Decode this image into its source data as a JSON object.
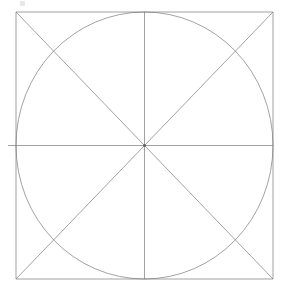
{
  "figure": {
    "background_color": "#ffffff",
    "stroke_color": "#7a7a7a",
    "stroke_width": 0.7,
    "canvas": {
      "width": 286,
      "height": 287
    },
    "square": {
      "label": "bounding-square",
      "x": 16,
      "y": 12,
      "width": 257,
      "height": 267
    },
    "circle": {
      "label": "inscribed-circle",
      "cx": 144.5,
      "cy": 145.5,
      "rx": 128.5,
      "ry": 133.5
    },
    "center_point": {
      "label": "center",
      "x": 144.5,
      "y": 145.5
    },
    "lines": [
      {
        "name": "diagonal-tl-br",
        "x1": 16,
        "y1": 12,
        "x2": 273,
        "y2": 279
      },
      {
        "name": "diagonal-tr-bl",
        "x1": 273,
        "y1": 12,
        "x2": 16,
        "y2": 279
      },
      {
        "name": "vertical-centerline",
        "x1": 144.5,
        "y1": 12,
        "x2": 144.5,
        "y2": 279
      },
      {
        "name": "horizontal-centerline",
        "x1": 8,
        "y1": 145.5,
        "x2": 273,
        "y2": 145.5
      }
    ],
    "artifact": {
      "name": "cursor-artifact",
      "x": 20,
      "y": 1
    }
  }
}
